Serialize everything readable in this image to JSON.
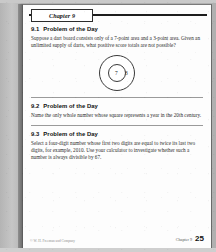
{
  "document": {
    "chapter_tab_label": "Chapter 9",
    "page_number": "25",
    "footer": {
      "copyright": "© W. H. Freeman and Company",
      "chapter_label": "Chapter 9"
    }
  },
  "sections": [
    {
      "number": "9.1",
      "title": "Problem of the Day",
      "body": "Suppose a dart board consists only of a 7-point area and a 3-point area. Given an unlimited supply of darts, what positive score totals are not possible?",
      "figure": {
        "type": "dartboard",
        "name": "dartboard-figure",
        "inner_value": "7",
        "outer_value": "3"
      }
    },
    {
      "number": "9.2",
      "title": "Problem of the Day",
      "body": "Name the only whole number whose square represents a year in the 20th century.",
      "figure": null
    },
    {
      "number": "9.3",
      "title": "Problem of the Day",
      "body": "Select a four-digit number whose first two digits are equal to twice its last two digits, for example, 2010. Use your calculator to investigate whether such a number is always divisible by 67.",
      "figure": null
    }
  ],
  "colors": {
    "page_background": "#fdfdfd",
    "scan_background": "#b9b9b9",
    "rule": "#1d1d1d",
    "text": "#2b2b2b"
  }
}
